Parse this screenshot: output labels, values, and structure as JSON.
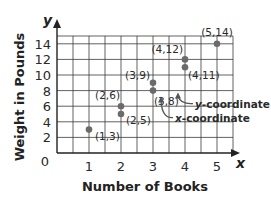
{
  "chart_data": {
    "type": "scatter",
    "title": "",
    "xlabel": "Number of Books",
    "ylabel": "Weight in Pounds",
    "x_axis_variable": "x",
    "y_axis_variable": "y",
    "xlim": [
      0,
      5.5
    ],
    "ylim": [
      0,
      15
    ],
    "x_ticks": [
      "1",
      "2",
      "3",
      "4",
      "5"
    ],
    "y_ticks": [
      "0",
      "2",
      "4",
      "6",
      "8",
      "10",
      "12",
      "14"
    ],
    "grid": true,
    "points": [
      {
        "x": 1,
        "y": 3,
        "label": "(1,3)"
      },
      {
        "x": 2,
        "y": 6,
        "label": "(2,6)"
      },
      {
        "x": 2,
        "y": 5,
        "label": "(2,5)"
      },
      {
        "x": 3,
        "y": 9,
        "label": "(3,9)"
      },
      {
        "x": 3,
        "y": 8,
        "label": "(3,8)"
      },
      {
        "x": 4,
        "y": 12,
        "label": "(4,12)"
      },
      {
        "x": 4,
        "y": 11,
        "label": "(4,11)"
      },
      {
        "x": 5,
        "y": 14,
        "label": "(5,14)"
      }
    ],
    "annotations": [
      {
        "target": "(3,8)",
        "part": "y",
        "text_var": "y",
        "text": "-coordinate"
      },
      {
        "target": "(3,8)",
        "part": "x",
        "text_var": "x",
        "text": "-coordinate"
      }
    ],
    "colors": {
      "point": "#6b6b6b",
      "grid": "#3a3a3a",
      "axis": "#222222"
    }
  }
}
